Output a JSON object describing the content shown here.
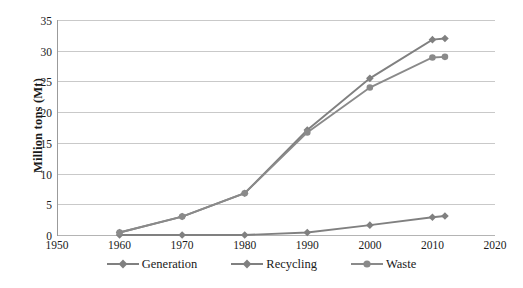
{
  "chart_data": {
    "type": "line",
    "title": "",
    "xlabel": "",
    "ylabel": "Million tons (Mt)",
    "xlim": [
      1950,
      2020
    ],
    "ylim": [
      0,
      35
    ],
    "xticks": [
      1950,
      1960,
      1970,
      1980,
      1990,
      2000,
      2010,
      2020
    ],
    "yticks": [
      0,
      5,
      10,
      15,
      20,
      25,
      30,
      35
    ],
    "grid": "horizontal",
    "legend_position": "bottom-center",
    "series": [
      {
        "name": "Generation",
        "marker": "diamond",
        "color": "#808080",
        "x": [
          1960,
          1970,
          1980,
          1990,
          2000,
          2010,
          2012
        ],
        "values": [
          0.4,
          3.0,
          6.8,
          17.1,
          25.5,
          31.8,
          32.0
        ]
      },
      {
        "name": "Recycling",
        "marker": "diamond",
        "color": "#808080",
        "x": [
          1960,
          1970,
          1980,
          1990,
          2000,
          2010,
          2012
        ],
        "values": [
          0.0,
          0.0,
          0.0,
          0.4,
          1.6,
          2.9,
          3.1
        ]
      },
      {
        "name": "Waste",
        "marker": "circle",
        "color": "#8a8a8a",
        "x": [
          1960,
          1970,
          1980,
          1990,
          2000,
          2010,
          2012
        ],
        "values": [
          0.4,
          3.0,
          6.8,
          16.7,
          24.0,
          28.9,
          29.0
        ]
      }
    ]
  },
  "axes": {
    "y_title": "Million tons (Mt)",
    "y_tick_labels": [
      "0",
      "5",
      "10",
      "15",
      "20",
      "25",
      "30",
      "35"
    ],
    "x_tick_labels": [
      "1950",
      "1960",
      "1970",
      "1980",
      "1990",
      "2000",
      "2010",
      "2020"
    ]
  },
  "legend": {
    "items": [
      {
        "label": "Generation",
        "marker": "diamond-marker-icon",
        "color": "#808080"
      },
      {
        "label": "Recycling",
        "marker": "diamond-marker-icon",
        "color": "#808080"
      },
      {
        "label": "Waste",
        "marker": "circle-marker-icon",
        "color": "#8a8a8a"
      }
    ]
  },
  "colors": {
    "gridline": "#c9c9c9",
    "axis": "#9b9b9b",
    "text": "#1a1a1a",
    "background": "#ffffff"
  }
}
